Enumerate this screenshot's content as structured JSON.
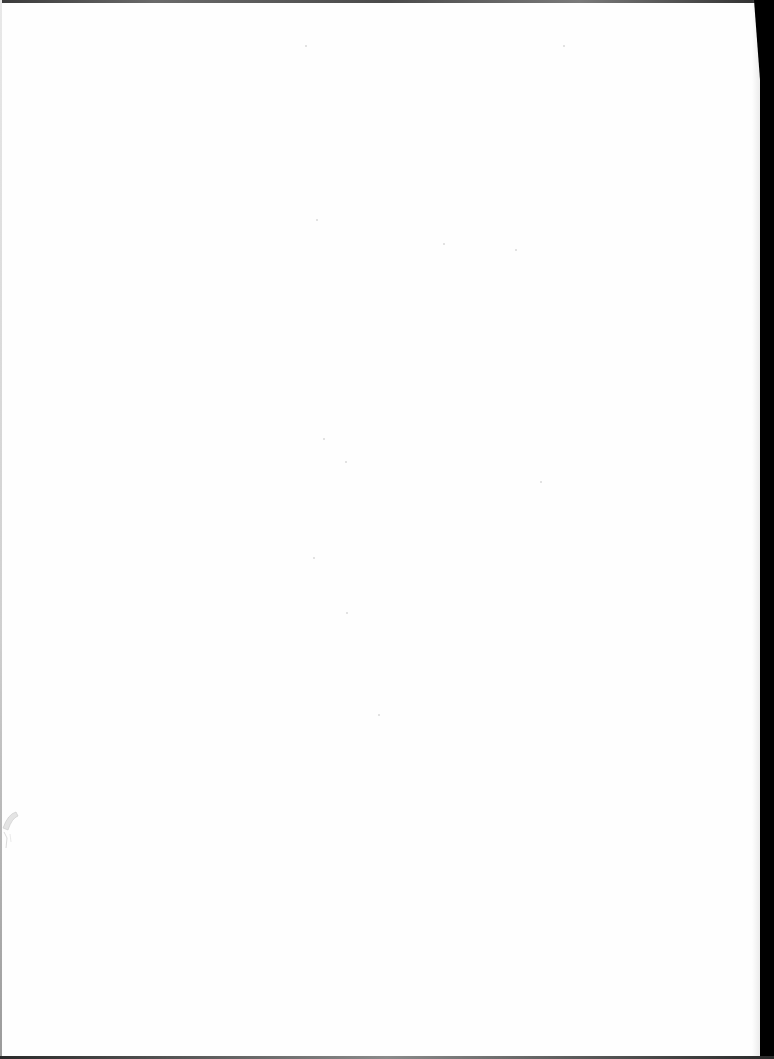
{
  "document": {
    "type": "scanned-page",
    "content": "",
    "is_blank": true
  },
  "colors": {
    "paper": "#fefefe",
    "scan_border": "#000000",
    "edge_gray": "#5a5a5a"
  }
}
